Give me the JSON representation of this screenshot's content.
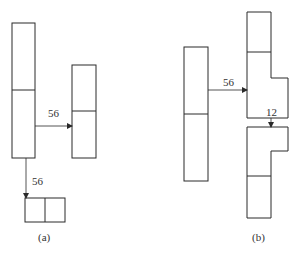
{
  "diagram": {
    "panel_a": {
      "caption": "(a)",
      "right_arrow_label": "56",
      "down_arrow_label": "56"
    },
    "panel_b": {
      "caption": "(b)",
      "right_arrow_label": "56",
      "down_arrow_label": "12"
    },
    "colors": {
      "stroke": "#2a2a2a",
      "background": "#ffffff"
    }
  }
}
